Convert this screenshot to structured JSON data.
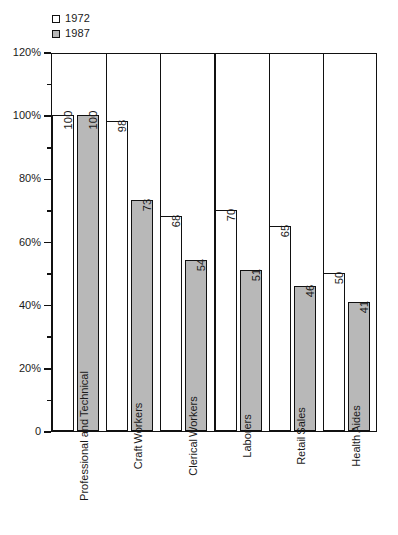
{
  "chart_data": {
    "type": "bar",
    "title": "",
    "xlabel": "",
    "ylabel": "",
    "categories": [
      "Professional and Technical",
      "Craft Workers",
      "Clerical Workers",
      "Laborers",
      "Retail Sales",
      "Health Aides"
    ],
    "category_lines": [
      [
        "Professional and",
        "Technical"
      ],
      [
        "Craft",
        "Workers"
      ],
      [
        "Clerical",
        "Workers"
      ],
      [
        "Laborers"
      ],
      [
        "Retail",
        "Sales"
      ],
      [
        "Health",
        "Aides"
      ]
    ],
    "series": [
      {
        "name": "1972",
        "color": "#ffffff",
        "values": [
          100,
          98,
          68,
          70,
          65,
          50
        ]
      },
      {
        "name": "1987",
        "color": "#b8b8b8",
        "values": [
          100,
          73,
          54,
          51,
          46,
          41
        ]
      }
    ],
    "ylim": [
      0,
      120
    ],
    "ytick_labels": [
      "0",
      "20%",
      "40%",
      "60%",
      "80%",
      "100%",
      "120%"
    ],
    "ytick_values": [
      0,
      20,
      40,
      60,
      80,
      100,
      120
    ],
    "yminor_values": [
      10,
      30,
      50,
      70,
      90,
      110
    ],
    "grid": "vertical-dividers",
    "legend_position": "top-left"
  },
  "legend": {
    "entries": [
      {
        "label": "1972",
        "color": "#ffffff"
      },
      {
        "label": "1987",
        "color": "#b8b8b8"
      }
    ]
  },
  "colors": {
    "axis": "#111111",
    "series_1972": "#ffffff",
    "series_1987": "#b8b8b8",
    "background": "#ffffff"
  }
}
